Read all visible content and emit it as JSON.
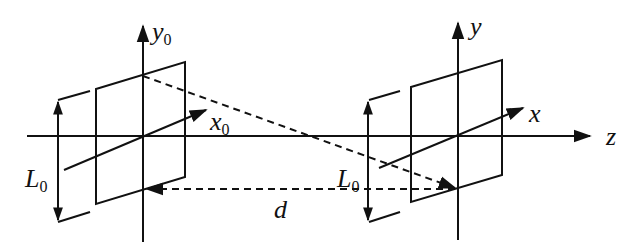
{
  "diagram": {
    "type": "coordinate-system-propagation",
    "labels": {
      "y0_main": "y",
      "y0_sub": "0",
      "x0_main": "x",
      "x0_sub": "0",
      "L0_left_main": "L",
      "L0_left_sub": "0",
      "L0_right_main": "L",
      "L0_right_sub": "0",
      "d": "d",
      "y": "y",
      "x": "x",
      "z": "z"
    },
    "colors": {
      "stroke": "#111111",
      "background": "#ffffff"
    },
    "planes": [
      {
        "name": "source-plane",
        "axes": [
          "x0",
          "y0"
        ],
        "aperture_label": "L0"
      },
      {
        "name": "observation-plane",
        "axes": [
          "x",
          "y"
        ],
        "aperture_label": "L0"
      }
    ],
    "distance_label": "d",
    "propagation_axis": "z"
  }
}
